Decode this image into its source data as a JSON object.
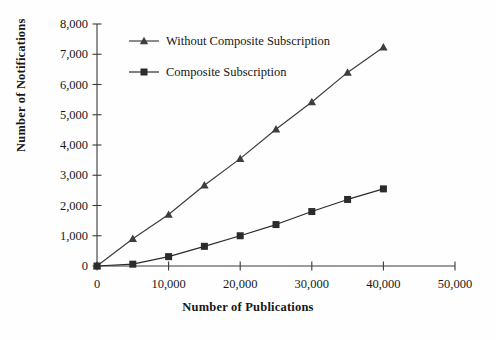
{
  "chart_data": {
    "type": "line",
    "title": "",
    "xlabel": "Number of Publications",
    "ylabel": "Number of Notifications",
    "xlim": [
      0,
      50000
    ],
    "ylim": [
      0,
      8000
    ],
    "grid": false,
    "legend_position": "upper-left-inside",
    "x_ticks": [
      0,
      10000,
      20000,
      30000,
      40000,
      50000
    ],
    "x_tick_labels": [
      "0",
      "10,000",
      "20,000",
      "30,000",
      "40,000",
      "50,000"
    ],
    "y_ticks": [
      0,
      1000,
      2000,
      3000,
      4000,
      5000,
      6000,
      7000,
      8000
    ],
    "y_tick_labels": [
      "0",
      "1,000",
      "2,000",
      "3,000",
      "4,000",
      "5,000",
      "6,000",
      "7,000",
      "8,000"
    ],
    "x": [
      0,
      5000,
      10000,
      15000,
      20000,
      25000,
      30000,
      35000,
      40000
    ],
    "series": [
      {
        "name": "Without Composite Subscription",
        "marker": "triangle",
        "color": "#3d3d3d",
        "values": [
          0,
          900,
          1700,
          2670,
          3550,
          4520,
          5420,
          6400,
          7230
        ]
      },
      {
        "name": "Composite Subscription",
        "marker": "square",
        "color": "#2b2b2b",
        "values": [
          0,
          60,
          310,
          650,
          1000,
          1370,
          1800,
          2200,
          2550
        ]
      }
    ]
  },
  "legend": {
    "items": [
      {
        "label": "Without Composite Subscription",
        "marker": "triangle"
      },
      {
        "label": "Composite Subscription",
        "marker": "square"
      }
    ]
  },
  "axes": {
    "y_title": "Number of Notifications",
    "x_title": "Number of Publications"
  }
}
